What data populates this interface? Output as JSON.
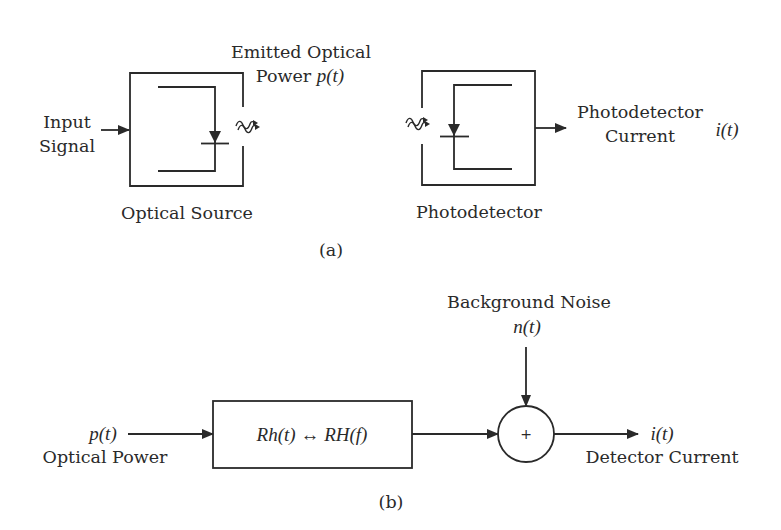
{
  "figure_a": {
    "caption": "(a)",
    "input_label_line1": "Input",
    "input_label_line2": "Signal",
    "emitted_label_line1": "Emitted Optical",
    "emitted_label_line2_text": "Power ",
    "emitted_label_line2_math": "p(t)",
    "source_label": "Optical Source",
    "detector_label": "Photodetector",
    "output_label_line1": "Photodetector",
    "output_label_line2": "Current",
    "output_math": "i(t)"
  },
  "figure_b": {
    "caption": "(b)",
    "input_math": "p(t)",
    "input_label": "Optical Power",
    "block_math": "Rh(t) ↔ RH(f)",
    "noise_label": "Background Noise",
    "noise_math": "n(t)",
    "summer_symbol": "+",
    "output_math": "i(t)",
    "output_label": "Detector Current"
  },
  "colors": {
    "ink": "#2a2a2a",
    "background": "#ffffff"
  }
}
